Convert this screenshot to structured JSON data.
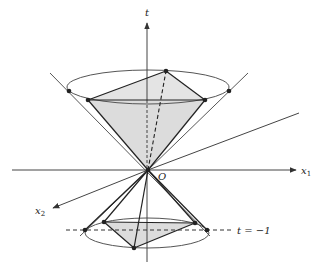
{
  "figure": {
    "colors": {
      "line": "#333333",
      "axis": "#444444",
      "ellipse": "#555555",
      "shade": "#d9d9d9",
      "point": "#222222",
      "background": "#ffffff"
    }
  },
  "axes": {
    "t": {
      "label": "t"
    },
    "x1": {
      "label": "x",
      "subscript": "1"
    },
    "x2": {
      "label": "x",
      "subscript": "2"
    },
    "origin": {
      "label": "O"
    }
  },
  "annotations": {
    "slice_label": "t = −1"
  }
}
